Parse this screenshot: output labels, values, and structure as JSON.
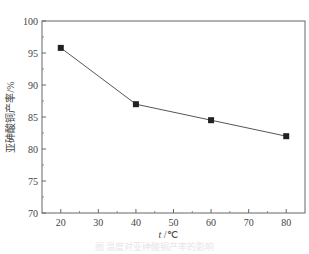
{
  "chart_data": {
    "type": "line",
    "title": "",
    "xlabel": "t/℃",
    "ylabel": "亚砷酸铜产率/%",
    "x": [
      20,
      40,
      60,
      80
    ],
    "series": [
      {
        "name": "亚砷酸铜产率",
        "values": [
          95.8,
          87.0,
          84.5,
          82.0
        ],
        "marker": "square",
        "color": "#444444"
      }
    ],
    "xlim": [
      15,
      85
    ],
    "ylim": [
      70,
      100
    ],
    "xticks": [
      20,
      30,
      40,
      50,
      60,
      70,
      80
    ],
    "yticks": [
      70,
      75,
      80,
      85,
      90,
      95,
      100
    ],
    "grid": false,
    "legend": "none"
  },
  "labels": {
    "x_axis_title": "t /℃",
    "y_axis_title": "亚砷酸铜产率/%"
  },
  "caption": "图 温度对亚砷酸铜产率的影响"
}
